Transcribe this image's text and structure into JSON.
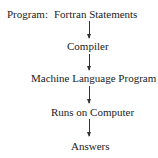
{
  "diagram": {
    "label": "Program:",
    "steps": [
      "Fortran Statements",
      "Compiler",
      "Machine Language Program",
      "Runs on Computer",
      "Answers"
    ]
  }
}
